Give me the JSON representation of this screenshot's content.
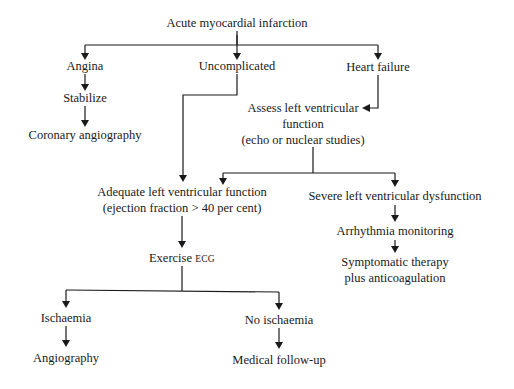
{
  "diagram": {
    "type": "flowchart",
    "root": "Acute myocardial infarction",
    "nodes": {
      "ami": "Acute myocardial infarction",
      "angina": "Angina",
      "stabilize": "Stabilize",
      "coronary_angiography": "Coronary angiography",
      "uncomplicated": "Uncomplicated",
      "heart_failure": "Heart failure",
      "assess_line1": "Assess left ventricular",
      "assess_line2": "function",
      "assess_line3": "(echo or nuclear studies)",
      "adequate_line1": "Adequate left ventricular function",
      "adequate_line2": "(ejection fraction > 40 per cent)",
      "severe": "Severe left ventricular dysfunction",
      "arrhythmia": "Arrhythmia monitoring",
      "symptomatic_line1": "Symptomatic therapy",
      "symptomatic_line2": "plus anticoagulation",
      "exercise_prefix": "Exercise ",
      "exercise_ecg": "ECG",
      "ischaemia": "Ischaemia",
      "angiography": "Angiography",
      "no_ischaemia": "No ischaemia",
      "medical_followup": "Medical follow-up"
    },
    "edges": [
      [
        "Acute myocardial infarction",
        "Angina"
      ],
      [
        "Acute myocardial infarction",
        "Uncomplicated"
      ],
      [
        "Acute myocardial infarction",
        "Heart failure"
      ],
      [
        "Angina",
        "Stabilize"
      ],
      [
        "Stabilize",
        "Coronary angiography"
      ],
      [
        "Uncomplicated",
        "Adequate left ventricular function"
      ],
      [
        "Heart failure",
        "Assess left ventricular function"
      ],
      [
        "Assess left ventricular function",
        "Adequate left ventricular function"
      ],
      [
        "Assess left ventricular function",
        "Severe left ventricular dysfunction"
      ],
      [
        "Severe left ventricular dysfunction",
        "Arrhythmia monitoring"
      ],
      [
        "Arrhythmia monitoring",
        "Symptomatic therapy plus anticoagulation"
      ],
      [
        "Adequate left ventricular function",
        "Exercise ECG"
      ],
      [
        "Exercise ECG",
        "Ischaemia"
      ],
      [
        "Exercise ECG",
        "No ischaemia"
      ],
      [
        "Ischaemia",
        "Angiography"
      ],
      [
        "No ischaemia",
        "Medical follow-up"
      ]
    ]
  }
}
